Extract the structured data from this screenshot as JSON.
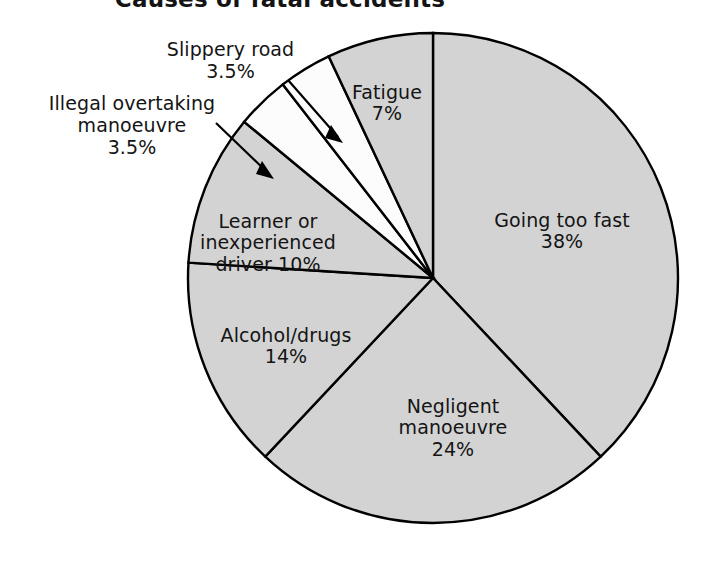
{
  "chart_data": {
    "type": "pie",
    "title": "Causes of fatal accidents",
    "xlabel": "",
    "ylabel": "",
    "legend": "none",
    "grid": false,
    "total": 100,
    "unit": "%",
    "start_angle_deg": 0,
    "direction": "clockwise",
    "categories": [
      "Going too fast",
      "Negligent manoeuvre",
      "Alcohol/drugs",
      "Learner or inexperienced driver",
      "Illegal overtaking manoeuvre",
      "Slippery road",
      "Fatigue"
    ],
    "values": [
      38,
      24,
      14,
      10,
      3.5,
      3.5,
      7
    ],
    "slices": [
      {
        "name": "Going too fast",
        "value": 38,
        "value_label": "38%",
        "label_text": "Going too fast\n38%",
        "color": "#d3d3d3",
        "label_placement": "inside"
      },
      {
        "name": "Negligent manoeuvre",
        "value": 24,
        "value_label": "24%",
        "label_text": "Negligent\nmanoeuvre\n24%",
        "color": "#d3d3d3",
        "label_placement": "inside"
      },
      {
        "name": "Alcohol/drugs",
        "value": 14,
        "value_label": "14%",
        "label_text": "Alcohol/drugs\n14%",
        "color": "#d3d3d3",
        "label_placement": "inside"
      },
      {
        "name": "Learner or inexperienced driver",
        "value": 10,
        "value_label": "10%",
        "label_text": "Learner or\ninexperienced\ndriver 10%",
        "color": "#d3d3d3",
        "label_placement": "inside"
      },
      {
        "name": "Illegal overtaking manoeuvre",
        "value": 3.5,
        "value_label": "3.5%",
        "label_text": "Illegal overtaking\nmanoeuvre\n3.5%",
        "color": "#fcfcfc",
        "label_placement": "callout"
      },
      {
        "name": "Slippery road",
        "value": 3.5,
        "value_label": "3.5%",
        "label_text": "Slippery road\n3.5%",
        "color": "#fcfcfc",
        "label_placement": "callout"
      },
      {
        "name": "Fatigue",
        "value": 7,
        "value_label": "7%",
        "label_text": "Fatigue\n7%",
        "color": "#d3d3d3",
        "label_placement": "inside"
      }
    ],
    "colors": {
      "slice_fill": "#d3d3d3",
      "thin_slice_fill": "#fcfcfc",
      "outline": "#000000",
      "text": "#141414",
      "background": "#ffffff"
    }
  }
}
